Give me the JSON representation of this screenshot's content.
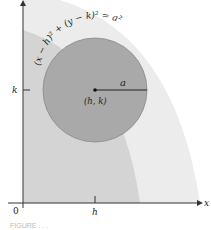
{
  "diagram": {
    "equation": "(x − h)² + (y − k)² = a²",
    "labels": {
      "center": "(h, k)",
      "radius": "a",
      "x_axis": "x",
      "origin": "0",
      "h_tick": "h",
      "k_tick": "k"
    },
    "circle": {
      "cx": 95,
      "cy": 90,
      "r": 52
    },
    "colors": {
      "circle_fill": "#a9a9a9",
      "outer_band": "#ececec",
      "inner_band": "#d2d2d2",
      "axis": "#333333"
    }
  },
  "caption": "FIGURE . . ."
}
